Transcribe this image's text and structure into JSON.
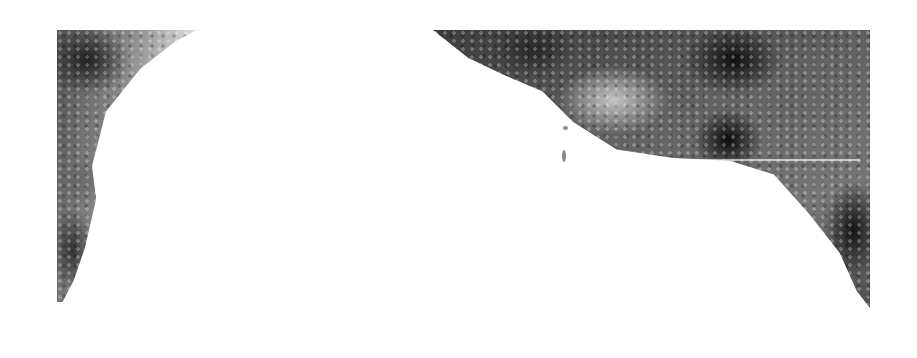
{
  "image": {
    "description": "Grayscale textured image with dark mottled regions in the top-left and top-right corners over a white background",
    "colors": {
      "background": "#ffffff",
      "dark": "#1e1e1e",
      "mid": "#777777"
    },
    "regions": [
      {
        "name": "left-texture-region"
      },
      {
        "name": "right-texture-region"
      }
    ]
  }
}
